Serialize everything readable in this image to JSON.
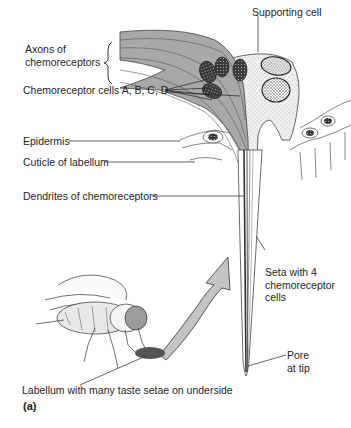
{
  "figure": {
    "panel_label": "(a)",
    "labels": {
      "supporting_cell": "Supporting cell",
      "axons": "Axons of\nchemoreceptors",
      "chemoreceptor_cells": "Chemoreceptor cells A, B, C, D",
      "epidermis": "Epidermis",
      "cuticle": "Cuticle of labellum",
      "dendrites": "Dendrites of chemoreceptors",
      "seta": "Seta with 4\nchemoreceptor\ncells",
      "pore": "Pore\nat tip",
      "labellum": "Labellum with many taste setae on underside"
    },
    "colors": {
      "neuron_fill": "#a8a8a8",
      "supporting_fill": "#ececec",
      "nucleus": "#3a3a3a",
      "arrow_fill": "#c4c4c4",
      "labellum_spot": "#555555",
      "line": "#2a2a2a"
    }
  }
}
